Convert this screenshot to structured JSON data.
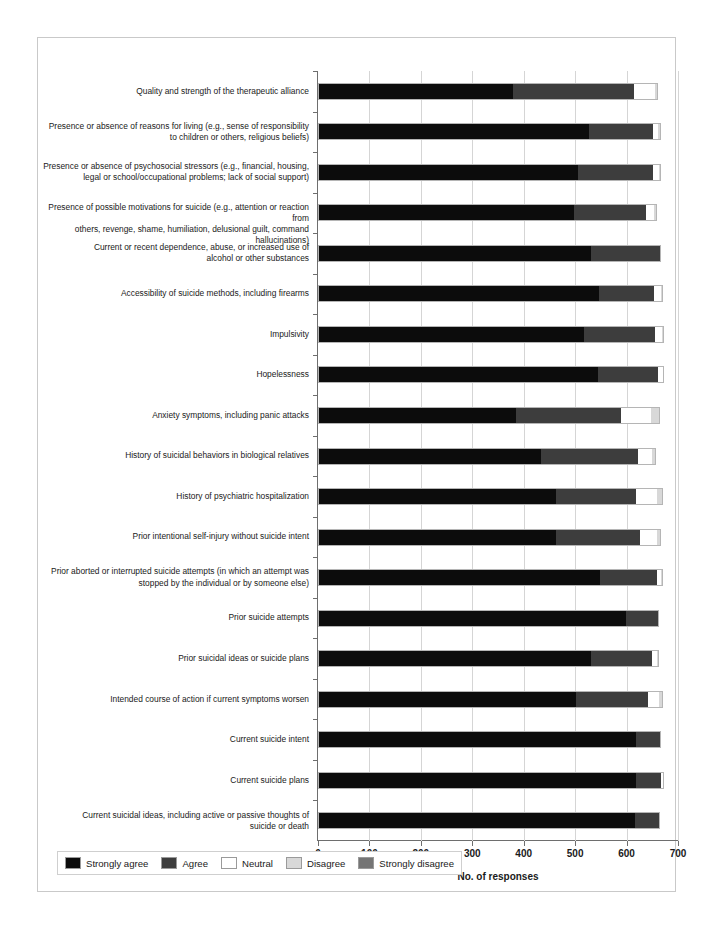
{
  "chart_data": {
    "type": "bar",
    "subtype": "stacked-horizontal-likert",
    "title": "",
    "xlabel": "No. of responses",
    "ylabel": "",
    "xlim": [
      0,
      700
    ],
    "xticks": [
      0,
      100,
      200,
      300,
      400,
      500,
      600,
      700
    ],
    "grid": true,
    "legend_position": "bottom-left",
    "legend": [
      "Strongly agree",
      "Agree",
      "Neutral",
      "Disagree",
      "Strongly disagree"
    ],
    "colors": {
      "Strongly agree": "#0c0c0c",
      "Agree": "#3d3d3d",
      "Neutral": "#ffffff",
      "Disagree": "#d8d8d8",
      "Strongly disagree": "#757575"
    },
    "categories": [
      "Quality and strength of the therapeutic alliance",
      "Presence or absence of reasons for living (e.g., sense of responsibility\nto children or others, religious beliefs)",
      "Presence or absence of psychosocial stressors (e.g., financial, housing,\nlegal or school/occupational problems; lack of social support)",
      "Presence of possible motivations for suicide (e.g., attention or reaction from\nothers, revenge, shame, humiliation, delusional guilt, command hallucinations)",
      "Current or recent dependence, abuse, or increased use of\nalcohol or other substances",
      "Accessibility of suicide methods, including firearms",
      "Impulsivity",
      "Hopelessness",
      "Anxiety symptoms, including panic attacks",
      "History of suicidal behaviors in biological relatives",
      "History of psychiatric hospitalization",
      "Prior intentional self-injury without suicide intent",
      "Prior aborted or interrupted suicide attempts (in which an attempt was\nstopped by the individual or by someone else)",
      "Prior suicide attempts",
      "Prior suicidal ideas or suicide plans",
      "Intended course of action if current symptoms worsen",
      "Current suicide intent",
      "Current suicide plans",
      "Current suicidal ideas, including active or passive thoughts of\nsuicide or death"
    ],
    "series": [
      {
        "name": "Strongly agree",
        "values": [
          379,
          527,
          505,
          497,
          531,
          547,
          517,
          544,
          385,
          434,
          463,
          463,
          549,
          599,
          531,
          502,
          618,
          618,
          617
        ]
      },
      {
        "name": "Agree",
        "values": [
          236,
          124,
          147,
          140,
          136,
          106,
          139,
          117,
          204,
          189,
          156,
          164,
          111,
          65,
          118,
          140,
          48,
          48,
          48
        ]
      },
      {
        "name": "Neutral",
        "values": [
          40,
          11,
          11,
          16,
          0,
          14,
          12,
          9,
          58,
          27,
          40,
          32,
          7,
          0,
          11,
          21,
          0,
          7,
          0
        ]
      },
      {
        "name": "Disagree",
        "values": [
          6,
          4,
          4,
          6,
          0,
          4,
          4,
          3,
          18,
          7,
          11,
          8,
          3,
          0,
          4,
          7,
          0,
          0,
          0
        ]
      },
      {
        "name": "Strongly disagree",
        "values": [
          0,
          0,
          0,
          0,
          0,
          0,
          0,
          0,
          0,
          0,
          0,
          0,
          0,
          0,
          0,
          0,
          0,
          0,
          0
        ]
      }
    ]
  }
}
